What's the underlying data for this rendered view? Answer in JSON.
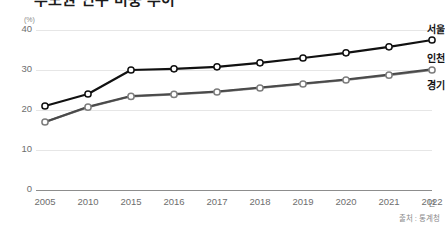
{
  "title": "수도권 인구 비중 추이",
  "unit_label": "(%)",
  "x_unit": "년",
  "source": "출처 : 통계청",
  "axes": {
    "y_ticks": [
      "40",
      "30",
      "20",
      "10",
      "0"
    ],
    "x_ticks": [
      "2005",
      "2010",
      "2015",
      "2016",
      "2017",
      "2018",
      "2019",
      "2020",
      "2021",
      "2022"
    ]
  },
  "series_labels": {
    "seoul": "서울",
    "incheon": "인천",
    "gyeonggi": "경기"
  },
  "colors": {
    "seoul": "#111111",
    "incheon": "#4a4a4a",
    "gyeonggi": "#7d7d7d",
    "gridline": "#e6e6e6",
    "axis": "#8d8d8d",
    "tick_text": "#6e6e6e"
  },
  "chart_data": {
    "type": "line",
    "title": "수도권 인구 비중 추이",
    "xlabel": "년",
    "ylabel": "(%)",
    "ylim": [
      0,
      42
    ],
    "y_ticks": [
      0,
      10,
      20,
      30,
      40
    ],
    "grid": true,
    "legend": "right-inline-labels",
    "categories": [
      "2005",
      "2010",
      "2015",
      "2016",
      "2017",
      "2018",
      "2019",
      "2020",
      "2021",
      "2022"
    ],
    "series": [
      {
        "name": "서울",
        "values": [
          21.0,
          24.0,
          30.0,
          30.3,
          30.8,
          31.8,
          33.0,
          34.3,
          35.8,
          37.5
        ]
      },
      {
        "name": "인천",
        "values": [
          17.0,
          20.8,
          23.5,
          24.0,
          24.6,
          25.6,
          26.6,
          27.6,
          28.9,
          30.2
        ]
      },
      {
        "name": "경기",
        "values": [
          17.0,
          20.7,
          23.4,
          23.9,
          24.5,
          25.5,
          26.5,
          27.5,
          28.7,
          30.0
        ]
      }
    ]
  }
}
